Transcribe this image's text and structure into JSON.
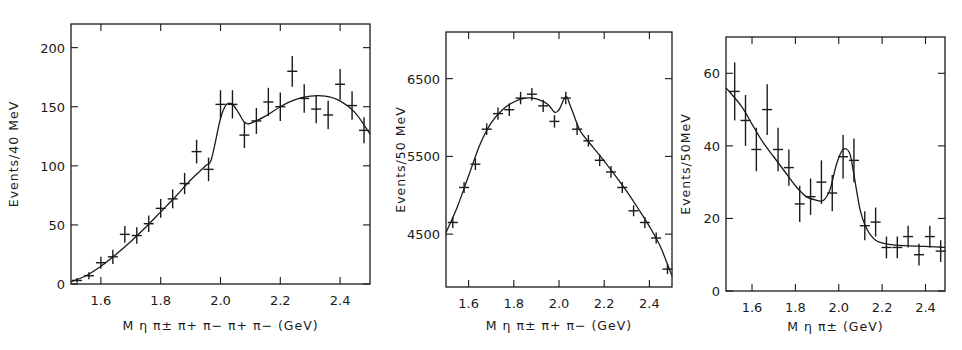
{
  "chart_data": [
    {
      "type": "scatter",
      "title": "",
      "xlabel": "M η π± π+ π− π+ π− (GeV)",
      "ylabel": "Events/40 MeV",
      "xlim": [
        1.5,
        2.5
      ],
      "ylim": [
        0,
        220
      ],
      "xticks": [
        "1.6",
        "1.8",
        "2.0",
        "2.2",
        "2.4"
      ],
      "yticks": [
        "0",
        "50",
        "100",
        "150",
        "200"
      ],
      "ytick_side": "left",
      "points": {
        "x": [
          1.52,
          1.56,
          1.6,
          1.64,
          1.68,
          1.72,
          1.76,
          1.8,
          1.84,
          1.88,
          1.92,
          1.96,
          2.0,
          2.04,
          2.08,
          2.12,
          2.16,
          2.2,
          2.24,
          2.28,
          2.32,
          2.36,
          2.4,
          2.44,
          2.48
        ],
        "y": [
          3,
          7,
          18,
          23,
          42,
          41,
          51,
          64,
          72,
          85,
          112,
          97,
          152,
          152,
          126,
          138,
          154,
          150,
          180,
          157,
          148,
          143,
          169,
          151,
          130
        ],
        "err": [
          2,
          3,
          5,
          6,
          7,
          7,
          7,
          8,
          8,
          9,
          10,
          10,
          12,
          12,
          11,
          11,
          12,
          12,
          13,
          12,
          12,
          12,
          13,
          12,
          11
        ]
      },
      "fit_curve": {
        "x": [
          1.5,
          1.55,
          1.6,
          1.65,
          1.7,
          1.75,
          1.8,
          1.85,
          1.9,
          1.95,
          1.97,
          2.0,
          2.02,
          2.04,
          2.06,
          2.08,
          2.1,
          2.15,
          2.2,
          2.25,
          2.3,
          2.35,
          2.4,
          2.45,
          2.5
        ],
        "y": [
          2,
          7,
          15,
          25,
          36,
          48,
          61,
          74,
          88,
          100,
          106,
          140,
          152,
          152,
          145,
          137,
          136,
          142,
          150,
          156,
          159,
          159,
          155,
          145,
          127
        ]
      }
    },
    {
      "type": "scatter",
      "title": "",
      "xlabel": "M η π± π+ π− (GeV)",
      "ylabel": "Events/50 MeV",
      "xlim": [
        1.5,
        2.5
      ],
      "ylim": [
        3820,
        7100
      ],
      "xticks": [
        "1.6",
        "1.8",
        "2.0",
        "2.2",
        "2.4"
      ],
      "yticks": [
        "4500",
        "5500",
        "6500"
      ],
      "ytick_side": "left",
      "points": {
        "x": [
          1.53,
          1.58,
          1.63,
          1.68,
          1.73,
          1.78,
          1.83,
          1.88,
          1.93,
          1.98,
          2.03,
          2.08,
          2.13,
          2.18,
          2.23,
          2.28,
          2.33,
          2.38,
          2.43,
          2.48
        ],
        "y": [
          4650,
          5100,
          5400,
          5850,
          6050,
          6100,
          6250,
          6300,
          6150,
          5950,
          6250,
          5850,
          5700,
          5450,
          5300,
          5100,
          4800,
          4650,
          4450,
          4050
        ],
        "err": [
          70,
          70,
          75,
          75,
          80,
          80,
          80,
          80,
          80,
          80,
          80,
          75,
          75,
          75,
          75,
          70,
          70,
          70,
          70,
          65
        ]
      },
      "fit_curve": {
        "x": [
          1.5,
          1.55,
          1.6,
          1.65,
          1.7,
          1.75,
          1.8,
          1.85,
          1.9,
          1.95,
          1.98,
          2.0,
          2.03,
          2.05,
          2.08,
          2.1,
          2.15,
          2.2,
          2.25,
          2.3,
          2.35,
          2.4,
          2.45,
          2.5
        ],
        "y": [
          4520,
          4850,
          5250,
          5650,
          5930,
          6100,
          6200,
          6250,
          6240,
          6170,
          6070,
          6100,
          6270,
          6150,
          5920,
          5800,
          5620,
          5440,
          5250,
          5050,
          4830,
          4600,
          4330,
          3960
        ]
      }
    },
    {
      "type": "scatter",
      "title": "",
      "xlabel": "M η π± (GeV)",
      "ylabel": "Events/50MeV",
      "xlim": [
        1.48,
        2.49
      ],
      "ylim": [
        0,
        70
      ],
      "xticks": [
        "1.6",
        "1.8",
        "2.0",
        "2.2",
        "2.4"
      ],
      "yticks": [
        "0",
        "20",
        "40",
        "60"
      ],
      "ytick_side": "left",
      "points": {
        "x": [
          1.52,
          1.57,
          1.62,
          1.67,
          1.72,
          1.77,
          1.82,
          1.87,
          1.92,
          1.97,
          2.02,
          2.07,
          2.12,
          2.17,
          2.22,
          2.27,
          2.32,
          2.37,
          2.42,
          2.47
        ],
        "y": [
          55,
          47,
          39,
          50,
          39,
          34,
          24,
          26,
          30,
          27,
          37,
          36,
          18,
          19,
          12,
          12,
          15,
          10,
          15,
          11
        ],
        "err": [
          8,
          7,
          6,
          7,
          6,
          5,
          5,
          5,
          6,
          5,
          6,
          6,
          4,
          4,
          3,
          3,
          3,
          3,
          3,
          3
        ]
      },
      "fit_curve": {
        "x": [
          1.48,
          1.55,
          1.6,
          1.65,
          1.7,
          1.75,
          1.8,
          1.85,
          1.9,
          1.93,
          1.96,
          1.99,
          2.02,
          2.05,
          2.07,
          2.1,
          2.13,
          2.17,
          2.22,
          2.3,
          2.4,
          2.49
        ],
        "y": [
          56,
          51,
          46,
          41,
          37,
          33,
          29,
          26,
          25,
          25,
          28,
          35,
          39,
          38,
          32,
          22,
          17,
          14,
          13,
          12.5,
          12.3,
          12
        ]
      }
    }
  ]
}
